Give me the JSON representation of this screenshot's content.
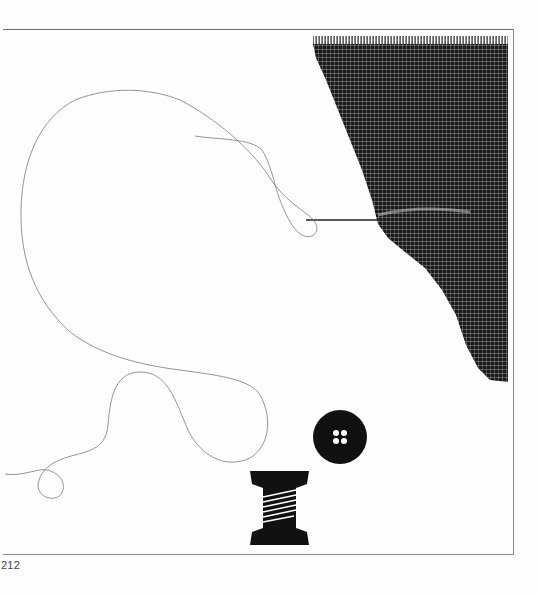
{
  "page": {
    "page_number": "212",
    "illustration": {
      "subject": "sewing illustration",
      "elements": [
        "woven-fabric-swatch",
        "needle",
        "thread",
        "button",
        "spool-of-thread"
      ],
      "button_holes": 4
    },
    "colors": {
      "ink": "#111111",
      "thread": "#7a7a7a",
      "frame": "#7a7a7a",
      "paper": "#fdfdfd"
    }
  }
}
